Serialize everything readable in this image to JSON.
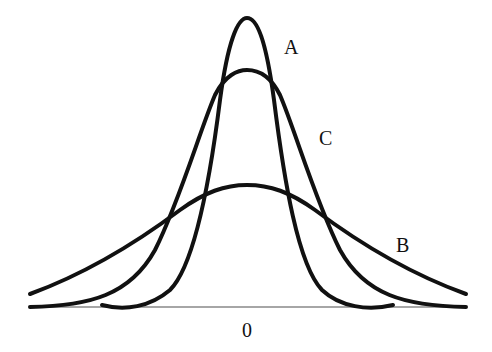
{
  "diagram": {
    "title": "",
    "type": "distribution curves comparison",
    "curves": [
      {
        "id": "A",
        "label": "A",
        "description": "tall narrow (leptokurtic)",
        "peak_y_px": 18,
        "color": "#111111"
      },
      {
        "id": "C",
        "label": "C",
        "description": "medium (mesokurtic)",
        "peak_y_px": 70,
        "color": "#111111"
      },
      {
        "id": "B",
        "label": "B",
        "description": "flat wide (platykurtic)",
        "peak_y_px": 185,
        "color": "#111111"
      }
    ],
    "axis": {
      "center_label": "0",
      "line_color": "#888888"
    }
  }
}
